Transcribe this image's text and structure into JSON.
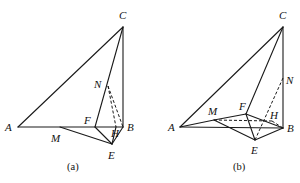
{
  "figures": [
    {
      "id": "a",
      "caption": "(a)",
      "points": {
        "A": {
          "label": "A",
          "x": 18,
          "y": 127,
          "lx": 5,
          "ly": 131
        },
        "B": {
          "label": "B",
          "x": 123,
          "y": 127,
          "lx": 127,
          "ly": 131
        },
        "C": {
          "label": "C",
          "x": 123,
          "y": 27,
          "lx": 119,
          "ly": 19
        },
        "F": {
          "label": "F",
          "x": 95,
          "y": 127,
          "lx": 84,
          "ly": 124
        },
        "N": {
          "label": "N",
          "x": 108,
          "y": 86,
          "lx": 94,
          "ly": 88
        },
        "H": {
          "label": "H",
          "x": 116,
          "y": 127,
          "lx": 111,
          "ly": 137
        },
        "E": {
          "label": "E",
          "x": 112,
          "y": 144,
          "lx": 108,
          "ly": 159
        },
        "M": {
          "label": "M",
          "x": 60,
          "y": 127,
          "lx": 51,
          "ly": 142
        }
      },
      "solid_edges": [
        [
          "A",
          "C"
        ],
        [
          "C",
          "B"
        ],
        [
          "C",
          "F"
        ],
        [
          "A",
          "B"
        ],
        [
          "M",
          "E"
        ],
        [
          "F",
          "E"
        ],
        [
          "E",
          "B"
        ],
        [
          "E",
          "H"
        ]
      ],
      "dashed_edges": [
        [
          "N",
          "H"
        ],
        [
          "N",
          "B"
        ]
      ],
      "caption_pos": {
        "x": 67,
        "y": 170
      }
    },
    {
      "id": "b",
      "caption": "(b)",
      "points": {
        "A": {
          "label": "A",
          "x": 180,
          "y": 127,
          "lx": 168,
          "ly": 131
        },
        "B": {
          "label": "B",
          "x": 283,
          "y": 128,
          "lx": 287,
          "ly": 132
        },
        "C": {
          "label": "C",
          "x": 283,
          "y": 27,
          "lx": 279,
          "ly": 19
        },
        "F": {
          "label": "F",
          "x": 246,
          "y": 114,
          "lx": 239,
          "ly": 110
        },
        "M": {
          "label": "M",
          "x": 214,
          "y": 120,
          "lx": 208,
          "ly": 115
        },
        "H": {
          "label": "H",
          "x": 272,
          "y": 121,
          "lx": 270,
          "ly": 119
        },
        "E": {
          "label": "E",
          "x": 255,
          "y": 140,
          "lx": 251,
          "ly": 154
        },
        "N": {
          "label": "N",
          "x": 283,
          "y": 78,
          "lx": 286,
          "ly": 84
        }
      },
      "solid_edges": [
        [
          "A",
          "C"
        ],
        [
          "C",
          "F"
        ],
        [
          "C",
          "B"
        ],
        [
          "A",
          "B"
        ],
        [
          "A",
          "M"
        ],
        [
          "M",
          "F"
        ],
        [
          "M",
          "E"
        ],
        [
          "F",
          "E"
        ],
        [
          "E",
          "B"
        ],
        [
          "F",
          "B"
        ]
      ],
      "dashed_edges": [
        [
          "M",
          "H"
        ],
        [
          "H",
          "B"
        ],
        [
          "E",
          "N"
        ]
      ],
      "caption_pos": {
        "x": 233,
        "y": 170
      }
    }
  ]
}
